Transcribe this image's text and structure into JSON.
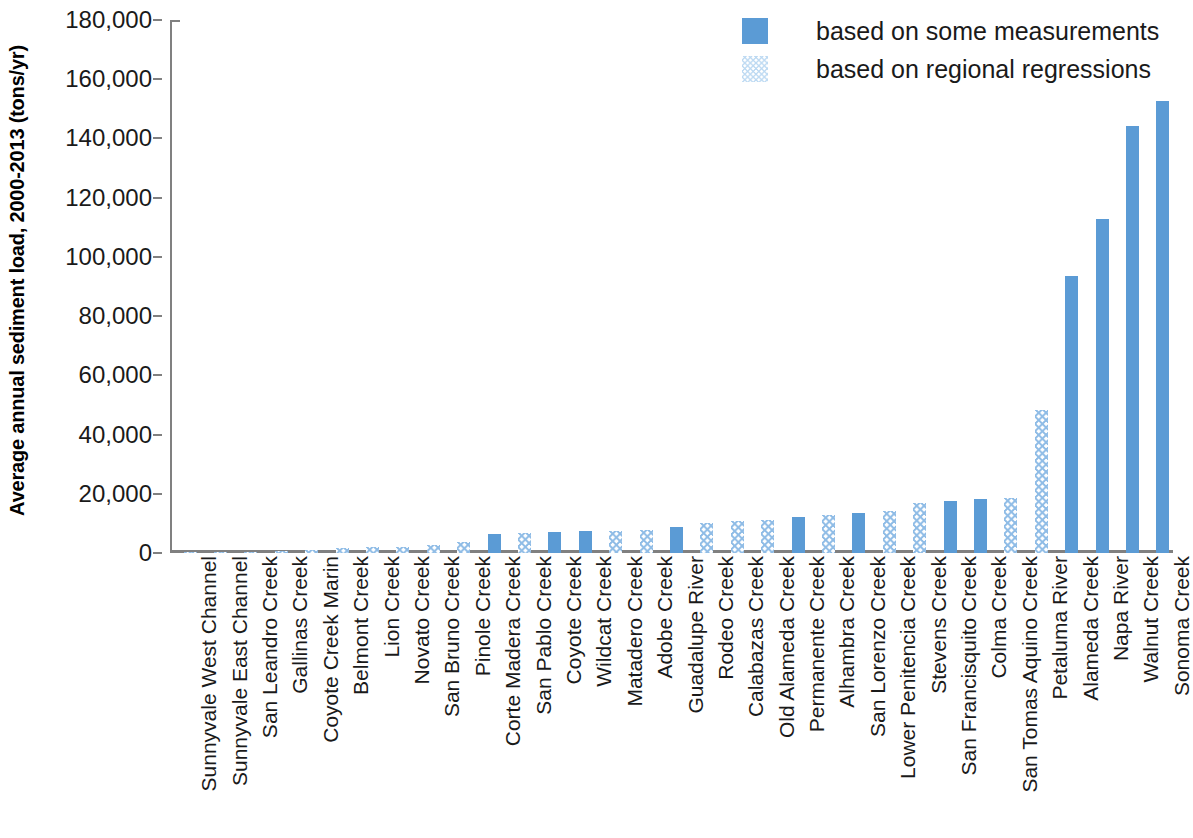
{
  "chart_data": {
    "type": "bar",
    "title": "",
    "xlabel": "",
    "ylabel": "Average annual sediment load, 2000-2013 (tons/yr)",
    "ylim": [
      0,
      180000
    ],
    "yticks": [
      0,
      20000,
      40000,
      60000,
      80000,
      100000,
      120000,
      140000,
      160000,
      180000
    ],
    "ytick_labels": [
      "0",
      "20,000",
      "40,000",
      "60,000",
      "80,000",
      "100,000",
      "120,000",
      "140,000",
      "160,000",
      "180,000"
    ],
    "grid": false,
    "legend_position": "top-right",
    "legend": [
      {
        "label": "based on some measurements",
        "swatch": "solid",
        "color": "#5b9bd5"
      },
      {
        "label": "based on regional regressions",
        "swatch": "hatch",
        "color": "#bcd9f2"
      }
    ],
    "categories": [
      "Sunnyvale West Channel",
      "Sunnyvale East Channel",
      "San Leandro Creek",
      "Gallinas Creek",
      "Coyote Creek Marin",
      "Belmont Creek",
      "Lion Creek",
      "Novato Creek",
      "San Bruno Creek",
      "Pinole Creek",
      "Corte Madera Creek",
      "San Pablo Creek",
      "Coyote Creek",
      "Wildcat Creek",
      "Matadero Creek",
      "Adobe Creek",
      "Guadalupe River",
      "Rodeo Creek",
      "Calabazas Creek",
      "Old Alameda Creek",
      "Permanente Creek",
      "Alhambra Creek",
      "San Lorenzo Creek",
      "Lower Penitencia Creek",
      "Stevens Creek",
      "San Francisquito Creek",
      "Colma Creek",
      "San Tomas Aquino Creek",
      "Petaluma River",
      "Alameda Creek",
      "Napa River",
      "Walnut Creek",
      "Sonoma Creek"
    ],
    "values": [
      60,
      120,
      350,
      600,
      900,
      1700,
      1900,
      2100,
      2600,
      3800,
      6400,
      6600,
      7000,
      7300,
      7600,
      7900,
      8700,
      10000,
      10800,
      11000,
      12200,
      13000,
      13500,
      14300,
      16800,
      17700,
      18200,
      18700,
      48200,
      93500,
      112700,
      144300,
      152800
    ],
    "series_kind": [
      "hatch",
      "hatch",
      "hatch",
      "hatch",
      "hatch",
      "hatch",
      "hatch",
      "hatch",
      "hatch",
      "hatch",
      "solid",
      "hatch",
      "solid",
      "solid",
      "hatch",
      "hatch",
      "solid",
      "hatch",
      "hatch",
      "hatch",
      "solid",
      "hatch",
      "solid",
      "hatch",
      "hatch",
      "solid",
      "solid",
      "hatch",
      "hatch",
      "solid",
      "solid",
      "solid",
      "solid"
    ]
  }
}
